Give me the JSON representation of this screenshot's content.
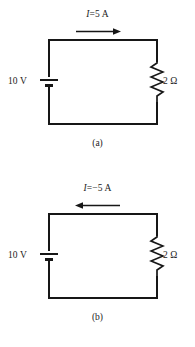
{
  "figure": {
    "type": "circuit-diagram-pair",
    "panels": [
      {
        "id": "a",
        "caption": "(a)",
        "current_label_symbol": "I",
        "current_label_equals": "=",
        "current_label_value": "5 A",
        "current_label_full": "I = 5 A",
        "current_direction": "right",
        "arrow_icon": "arrow-right-icon",
        "source_label": "10 V",
        "source_symbol": "battery-icon",
        "resistor_label": "2 Ω",
        "resistor_symbol": "resistor-zigzag-icon"
      },
      {
        "id": "b",
        "caption": "(b)",
        "current_label_symbol": "I",
        "current_label_equals": "=",
        "current_label_value": "−5 A",
        "current_label_full": "I = −5 A",
        "current_direction": "left",
        "arrow_icon": "arrow-left-icon",
        "source_label": "10 V",
        "source_symbol": "battery-icon",
        "resistor_label": "2 Ω",
        "resistor_symbol": "resistor-zigzag-icon"
      }
    ]
  },
  "colors": {
    "background": "#ffffff",
    "ink": "#171717",
    "text": "#1b1b1b"
  }
}
